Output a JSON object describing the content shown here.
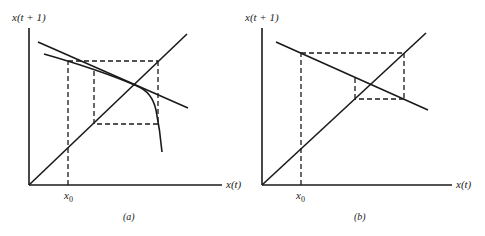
{
  "panels": [
    {
      "id": "a",
      "caption": "(a)",
      "y_axis_label": "x(t + 1)",
      "x_axis_label": "x(t)",
      "x0_label": "x",
      "x0_sub": "0",
      "description": "Cobweb diagram: 45-degree line, tangent line, and curved map; dashed cobweb path converging around fixed point"
    },
    {
      "id": "b",
      "caption": "(b)",
      "y_axis_label": "x(t + 1)",
      "x_axis_label": "x(t)",
      "x0_label": "x",
      "x0_sub": "0",
      "description": "Cobweb diagram: 45-degree line and decreasing linear map; dashed cobweb spiral converging to intersection"
    }
  ],
  "colors": {
    "line": "#1a1a1a",
    "background": "#ffffff"
  }
}
